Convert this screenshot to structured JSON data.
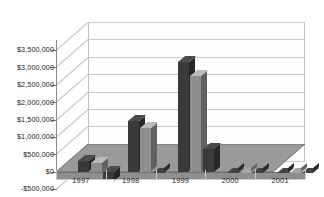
{
  "chart_data": {
    "type": "bar",
    "title": "",
    "xlabel": "",
    "ylabel": "",
    "categories": [
      "1997",
      "1998",
      "1999",
      "2000",
      "2001"
    ],
    "series": [
      {
        "name": "Series 1",
        "color": "#3a3a3a",
        "values": [
          300000,
          1450000,
          3150000,
          0,
          0
        ]
      },
      {
        "name": "Series 2",
        "color": "#8f8f8f",
        "values": [
          250000,
          1250000,
          2750000,
          0,
          0
        ]
      },
      {
        "name": "Series 3",
        "color": "#3a3a3a",
        "values": [
          -250000,
          0,
          650000,
          0,
          0
        ]
      }
    ],
    "ylim": [
      -500000,
      3500000
    ],
    "ytick_values": [
      3500000,
      3000000,
      2500000,
      2000000,
      1500000,
      1000000,
      500000,
      0,
      -500000
    ],
    "ytick_labels": [
      "$3,500,000",
      "$3,000,000",
      "$2,500,000",
      "$2,000,000",
      "$1,500,000",
      "$1,000,000",
      "$500,000",
      "$0",
      "-$500,000"
    ],
    "grid": true,
    "legend": "none",
    "three_d": true,
    "plot_background": "#ffffff",
    "gridline_color": "#c9c9c9",
    "floor_color": "#8e8e8e",
    "axis_color": "#8a8a8a"
  }
}
